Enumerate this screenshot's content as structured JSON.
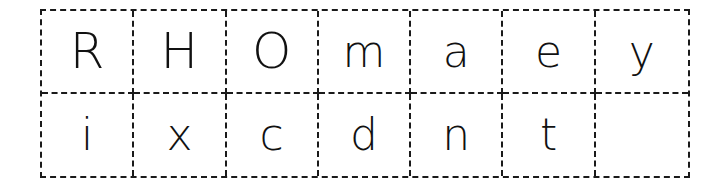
{
  "rows": [
    [
      "R",
      "H",
      "O",
      "m",
      "a",
      "e",
      "y"
    ],
    [
      "i",
      "x",
      "c",
      "d",
      "n",
      "t",
      ""
    ]
  ]
}
